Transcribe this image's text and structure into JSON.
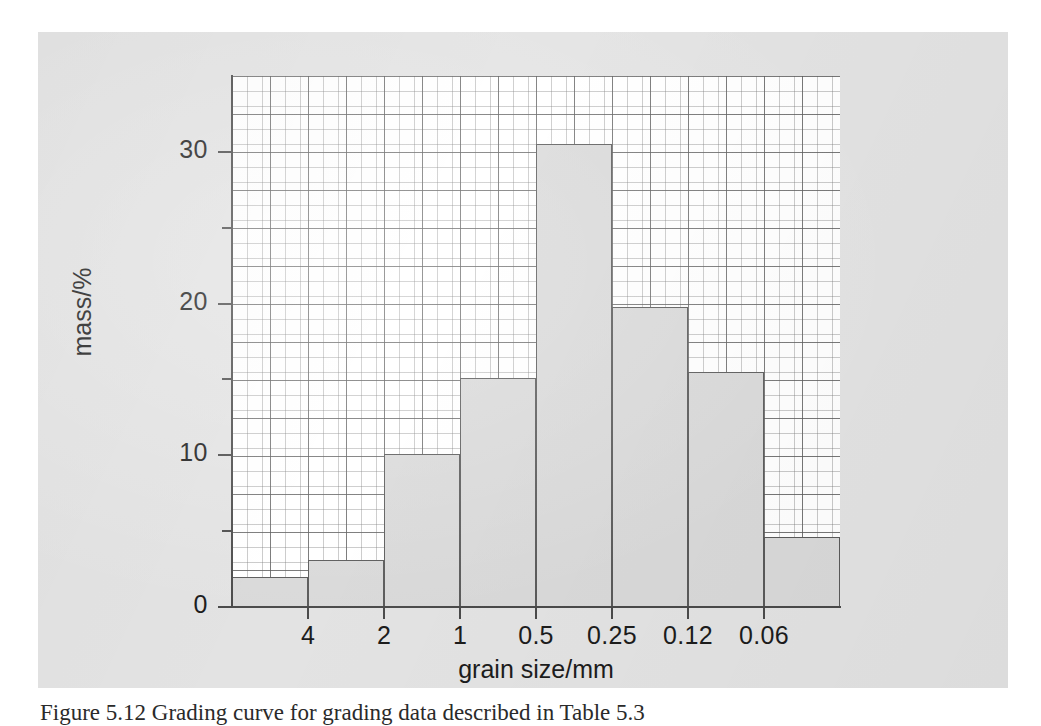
{
  "figure": {
    "background_color": "#e3e3e3",
    "plot_background_color": "#ffffff",
    "bar_fill_color": "#d9d9d9",
    "bar_border_color": "#5a5a5a",
    "axis_color": "#4a4a4a",
    "grid_major_color": "#5a5a5a",
    "grid_minor_color": "#787878"
  },
  "caption": {
    "text": "Figure 5.12 Grading curve for grading data described in Table 5.3"
  },
  "chart_data": {
    "type": "bar",
    "title": "",
    "xlabel": "grain size/mm",
    "ylabel": "mass/%",
    "categories": [
      "",
      "4",
      "2",
      "1",
      "0.5",
      "0.25",
      "0.12",
      "0.06"
    ],
    "bin_edge_labels": [
      "4",
      "2",
      "1",
      "0.5",
      "0.25",
      "0.12",
      "0.06"
    ],
    "values": [
      2.0,
      3.1,
      10.1,
      15.1,
      30.5,
      19.8,
      15.5,
      4.6
    ],
    "ylim": [
      0,
      35
    ],
    "y_major_ticks": [
      0,
      10,
      20,
      30
    ],
    "y_minor_ticks": [
      5,
      15,
      25
    ],
    "y_tick_labels": [
      "0",
      "10",
      "20",
      "30"
    ],
    "grid": true,
    "grid_style": "graph-paper",
    "legend": "none",
    "bars": [
      {
        "label": ">4",
        "upper_label": "",
        "value": 2.0
      },
      {
        "label": "4-2",
        "upper_label": "4",
        "value": 3.1
      },
      {
        "label": "2-1",
        "upper_label": "2",
        "value": 10.1
      },
      {
        "label": "1-0.5",
        "upper_label": "1",
        "value": 15.1
      },
      {
        "label": "0.5-0.25",
        "upper_label": "0.5",
        "value": 30.5
      },
      {
        "label": "0.25-0.12",
        "upper_label": "0.25",
        "value": 19.8
      },
      {
        "label": "0.12-0.06",
        "upper_label": "0.12",
        "value": 15.5
      },
      {
        "label": "<0.06",
        "upper_label": "0.06",
        "value": 4.6
      }
    ]
  }
}
